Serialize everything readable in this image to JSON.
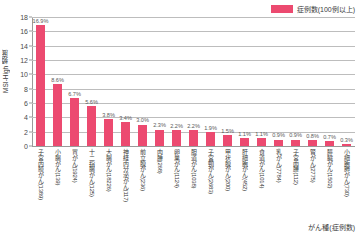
{
  "chart_data": {
    "type": "bar",
    "title": "",
    "xlabel": "がん種(症例数)",
    "ylabel": "MSI-High 頻度",
    "ylim": [
      0,
      18
    ],
    "yticks": [
      0,
      2,
      4,
      6,
      8,
      10,
      12,
      14,
      16,
      18
    ],
    "grid": true,
    "legend_position": "top-right",
    "legend": [
      "症例数(100例以上)"
    ],
    "series_color": "#ec4a70",
    "categories": [
      "子宮内膜がん(1389)",
      "小腸がん(139)",
      "胃がん(1924)",
      "十二指腸がん(125)",
      "大腸がん(18226)",
      "神経内分泌がん(117)",
      "前立腺がん(236)",
      "肉腫(268)",
      "卵巣がん(1124)",
      "胆道がん(1038)",
      "子宮頸がん(2683)",
      "甲状腺がん(200)",
      "肝細胞がん(452)",
      "食道がん(1014)",
      "乳がん(7784)",
      "子宮肉腫(112)",
      "腎がん(2775)",
      "膵臓がん(1502)",
      "小細胞肺がん(730)"
    ],
    "values": [
      16.9,
      8.6,
      6.7,
      5.6,
      3.8,
      3.4,
      3.0,
      2.3,
      2.2,
      2.2,
      1.9,
      1.5,
      1.1,
      1.1,
      0.9,
      0.9,
      0.8,
      0.7,
      0.3
    ],
    "value_labels": [
      "16.9%",
      "8.6%",
      "6.7%",
      "5.6%",
      "3.8%",
      "3.4%",
      "3.0%",
      "2.3%",
      "2.2%",
      "2.2%",
      "1.9%",
      "1.5%",
      "1.1%",
      "1.1%",
      "0.9%",
      "0.9%",
      "0.8%",
      "0.7%",
      "0.3%"
    ]
  }
}
